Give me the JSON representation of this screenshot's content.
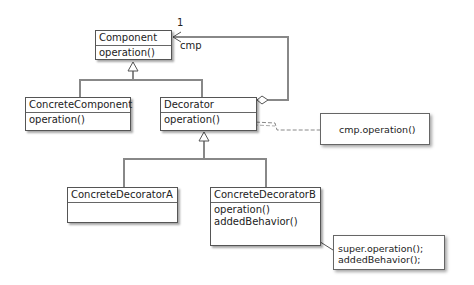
{
  "diagram": {
    "type": "UML class diagram - Decorator pattern",
    "classes": {
      "component": {
        "name": "Component",
        "operations": [
          "operation()"
        ]
      },
      "concrete_component": {
        "name": "ConcreteComponent",
        "operations": [
          "operation()"
        ]
      },
      "decorator": {
        "name": "Decorator",
        "operations": [
          "operation()"
        ]
      },
      "concrete_decorator_a": {
        "name": "ConcreteDecoratorA",
        "operations": []
      },
      "concrete_decorator_b": {
        "name": "ConcreteDecoratorB",
        "operations": [
          "operation()",
          "addedBehavior()"
        ]
      }
    },
    "notes": {
      "decorator_note": {
        "lines": [
          "cmp.operation()"
        ]
      },
      "decorator_b_note": {
        "lines": [
          "super.operation();",
          "addedBehavior();"
        ]
      }
    },
    "association": {
      "multiplicity": "1",
      "role": "cmp"
    },
    "colors": {
      "line": "#888888",
      "border": "#555555",
      "text": "#222222"
    }
  }
}
